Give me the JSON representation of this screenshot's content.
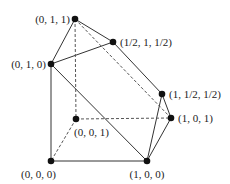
{
  "figure": {
    "type": "polytope-diagram",
    "vertices": [
      {
        "id": "v011",
        "label": "(0, 1, 1)"
      },
      {
        "id": "v_half1half",
        "label": "(1/2, 1, 1/2)"
      },
      {
        "id": "v010",
        "label": "(0, 1, 0)"
      },
      {
        "id": "v1halfhalf",
        "label": "(1, 1/2, 1/2)"
      },
      {
        "id": "v101",
        "label": "(1, 0, 1)"
      },
      {
        "id": "v001",
        "label": "(0, 0, 1)"
      },
      {
        "id": "v000",
        "label": "(0, 0, 0)"
      },
      {
        "id": "v100",
        "label": "(1, 0, 0)"
      }
    ],
    "edges": [
      {
        "from": "v011",
        "to": "v010",
        "style": "solid"
      },
      {
        "from": "v011",
        "to": "v_half1half",
        "style": "solid"
      },
      {
        "from": "v010",
        "to": "v_half1half",
        "style": "solid"
      },
      {
        "from": "v010",
        "to": "v000",
        "style": "solid"
      },
      {
        "from": "v010",
        "to": "v100",
        "style": "solid"
      },
      {
        "from": "v_half1half",
        "to": "v1halfhalf",
        "style": "solid"
      },
      {
        "from": "v1halfhalf",
        "to": "v100",
        "style": "solid"
      },
      {
        "from": "v1halfhalf",
        "to": "v101",
        "style": "solid"
      },
      {
        "from": "v101",
        "to": "v100",
        "style": "solid"
      },
      {
        "from": "v000",
        "to": "v100",
        "style": "solid"
      },
      {
        "from": "v011",
        "to": "v001",
        "style": "dashed"
      },
      {
        "from": "v011",
        "to": "v101",
        "style": "dashed"
      },
      {
        "from": "v001",
        "to": "v000",
        "style": "dashed"
      },
      {
        "from": "v001",
        "to": "v101",
        "style": "dashed"
      }
    ]
  }
}
